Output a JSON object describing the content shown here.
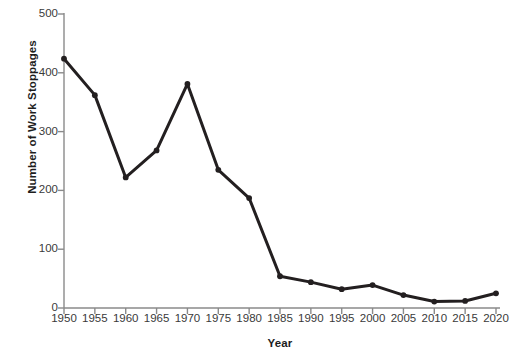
{
  "figure": {
    "background_color": "#ffffff",
    "line_color": "#231f20",
    "marker_color": "#231f20",
    "axis_color": "#8a8a8a",
    "tick_label_color": "#3a3a3a",
    "axis_title_color": "#1d1d1d",
    "cut_off_glyph": "f"
  },
  "chart_data": {
    "type": "line",
    "title": "",
    "xlabel": "Year",
    "ylabel": "Number of Work Stoppages",
    "categories": [
      "1950",
      "1955",
      "1960",
      "1965",
      "1970",
      "1975",
      "1980",
      "1985",
      "1990",
      "1995",
      "2000",
      "2005",
      "2010",
      "2015",
      "2020"
    ],
    "x": [
      1950,
      1955,
      1960,
      1965,
      1970,
      1975,
      1980,
      1985,
      1990,
      1995,
      2000,
      2005,
      2010,
      2015,
      2020
    ],
    "values": [
      424,
      362,
      222,
      268,
      381,
      235,
      187,
      54,
      44,
      32,
      39,
      22,
      11,
      12,
      25
    ],
    "series": [
      {
        "name": "Number of Work Stoppages",
        "values": [
          424,
          362,
          222,
          268,
          381,
          235,
          187,
          54,
          44,
          32,
          39,
          22,
          11,
          12,
          25
        ]
      }
    ],
    "xlim": [
      1950,
      2020
    ],
    "ylim": [
      0,
      500
    ],
    "yticks": [
      0,
      100,
      200,
      300,
      400,
      500
    ],
    "ytick_labels": [
      "0",
      "100",
      "200",
      "300",
      "400",
      "500"
    ],
    "xticks": [
      1950,
      1955,
      1960,
      1965,
      1970,
      1975,
      1980,
      1985,
      1990,
      1995,
      2000,
      2005,
      2010,
      2015,
      2020
    ],
    "xtick_labels": [
      "1950",
      "1955",
      "1960",
      "1965",
      "1970",
      "1975",
      "1980",
      "1985",
      "1990",
      "1995",
      "2000",
      "2005",
      "2010",
      "2015",
      "2020"
    ],
    "grid": false,
    "legend": false,
    "legend_position": "none",
    "markers": true,
    "annotations": []
  }
}
